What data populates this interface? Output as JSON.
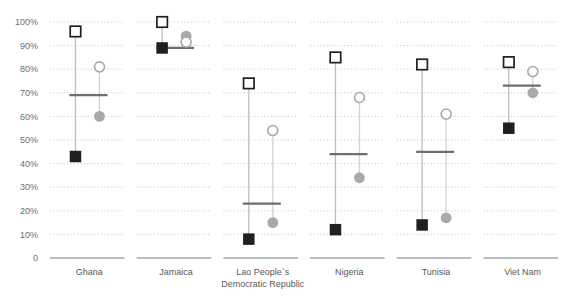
{
  "chart_data": {
    "type": "scatter",
    "title": "",
    "xlabel": "",
    "ylabel": "",
    "ylim": [
      0,
      100
    ],
    "grid": true,
    "grid_style": "dotted-horizontal",
    "legend": "none",
    "axis_suffix": "%",
    "categories": [
      "Ghana",
      "Jamaica",
      "Lao Peopleˋs\nDemocratic Republic",
      "Nigeria",
      "Tunisia",
      "Viet Nam"
    ],
    "yticks": [
      {
        "value": 100,
        "label": "100%"
      },
      {
        "value": 90,
        "label": "90%"
      },
      {
        "value": 80,
        "label": "80%"
      },
      {
        "value": 70,
        "label": "70%"
      },
      {
        "value": 60,
        "label": "60%"
      },
      {
        "value": 50,
        "label": "50%"
      },
      {
        "value": 40,
        "label": "40%"
      },
      {
        "value": 30,
        "label": "30%"
      },
      {
        "value": 20,
        "label": "20%"
      },
      {
        "value": 10,
        "label": "10%"
      },
      {
        "value": 0,
        "label": "0"
      }
    ],
    "series": [
      {
        "name": "open-square-high",
        "marker": "open-square",
        "color": "#231f20",
        "values": [
          96,
          100,
          74,
          85,
          82,
          83
        ]
      },
      {
        "name": "filled-square-low",
        "marker": "filled-square",
        "color": "#231f20",
        "values": [
          43,
          89,
          8,
          12,
          14,
          55
        ]
      },
      {
        "name": "open-circle-high",
        "marker": "open-circle",
        "color": "#a7a9ac",
        "values": [
          81,
          91.5,
          54,
          68,
          61,
          79
        ]
      },
      {
        "name": "filled-circle-low",
        "marker": "filled-circle",
        "color": "#a7a9ac",
        "values": [
          60,
          94,
          15,
          34,
          17,
          70
        ]
      },
      {
        "name": "mean-bar",
        "marker": "horizontal-bar",
        "color": "#6d6e71",
        "values": [
          69,
          89,
          23,
          44,
          45,
          73
        ]
      }
    ]
  }
}
